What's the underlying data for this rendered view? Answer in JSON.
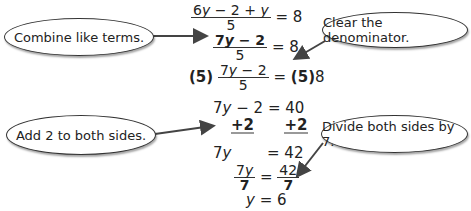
{
  "callouts": [
    {
      "id": "combine",
      "text": "Combine like terms."
    },
    {
      "id": "clear",
      "text": "Clear the denominator."
    },
    {
      "id": "add",
      "text": "Add 2 to both sides."
    },
    {
      "id": "divide",
      "text": "Divide both sides by 7."
    }
  ],
  "steps": {
    "s1": {
      "num_a": "6",
      "var": "y",
      "num_b": " − 2 + ",
      "num_var2": "y",
      "den": "5",
      "rhs": "= 8"
    },
    "s2": {
      "num_a": "7",
      "var": "y",
      "num_b": " − 2",
      "den": "5",
      "rhs": "= 8"
    },
    "s3": {
      "mult": "(5)",
      "num_a": "7",
      "var": "y",
      "num_b": " − 2",
      "den": "5",
      "eq": "=",
      "rhs_mult": "(5)",
      "rhs": "8"
    },
    "s4": {
      "lhs_a": "7",
      "var": "y",
      "lhs_b": " − 2",
      "rhs": "= 40"
    },
    "s5": {
      "left": "+2",
      "right": "+2"
    },
    "s6": {
      "lhs_a": "7",
      "var": "y",
      "rhs": "= 42"
    },
    "s7": {
      "num_a": "7",
      "var": "y",
      "den": "7",
      "eq": "=",
      "rnum": "42",
      "rden": "7"
    },
    "s8": {
      "var": "y",
      "rhs": "= 6"
    }
  },
  "colors": {
    "ink": "#222222",
    "arrow": "#444444",
    "underline": "#999999"
  }
}
